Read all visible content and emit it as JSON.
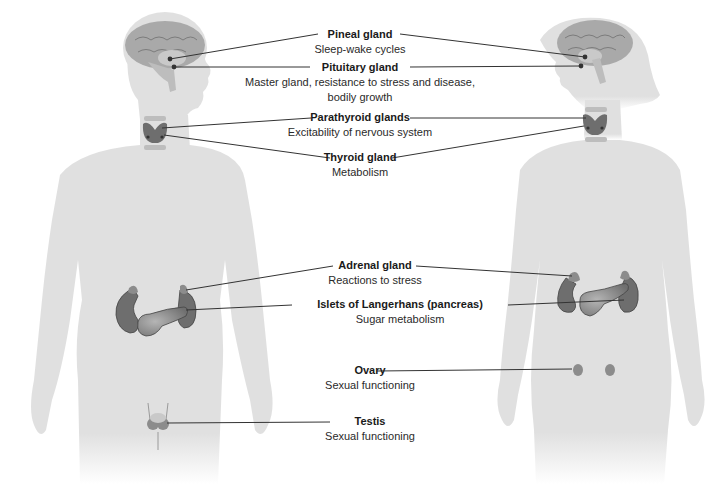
{
  "diagram": {
    "colors": {
      "body_silhouette": "#e0e0e0",
      "gland_dark": "#6e6e6e",
      "gland_mid": "#8c8c8c",
      "brain": "#a9a9a9",
      "leader_line": "#333333"
    },
    "figures": [
      {
        "id": "male",
        "label": "Male figure"
      },
      {
        "id": "female",
        "label": "Female figure"
      }
    ],
    "glands": [
      {
        "id": "pineal",
        "name": "Pineal gland",
        "function": "Sleep-wake cycles"
      },
      {
        "id": "pituitary",
        "name": "Pituitary gland",
        "function": "Master gland, resistance to stress and disease,",
        "function_line2": "bodily growth"
      },
      {
        "id": "parathyroid",
        "name": "Parathyroid glands",
        "function": "Excitability of nervous system"
      },
      {
        "id": "thyroid",
        "name": "Thyroid gland",
        "function": "Metabolism"
      },
      {
        "id": "adrenal",
        "name": "Adrenal gland",
        "function": "Reactions to stress"
      },
      {
        "id": "islets",
        "name": "Islets of Langerhans (pancreas)",
        "function": "Sugar metabolism"
      },
      {
        "id": "ovary",
        "name": "Ovary",
        "function": "Sexual functioning"
      },
      {
        "id": "testis",
        "name": "Testis",
        "function": "Sexual functioning"
      }
    ]
  }
}
